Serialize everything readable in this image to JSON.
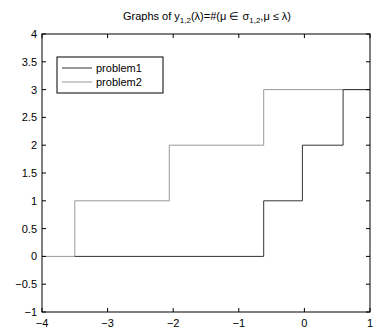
{
  "chart_data": {
    "type": "line",
    "subtype": "step",
    "title_parts": {
      "prefix": "Graphs of y",
      "sub1": "1,2",
      "middle": "(λ)=#(μ ∈ σ",
      "sub2": "1,2",
      "suffix": ",μ ≤ λ)"
    },
    "xlabel": "",
    "ylabel": "",
    "xlim": [
      -4,
      1
    ],
    "ylim": [
      -1,
      4
    ],
    "xticks": [
      -4,
      -3,
      -2,
      -1,
      0,
      1
    ],
    "xtick_labels": [
      "−4",
      "−3",
      "−2",
      "−1",
      "0",
      "1"
    ],
    "yticks": [
      -1,
      -0.5,
      0,
      0.5,
      1,
      1.5,
      2,
      2.5,
      3,
      3.5,
      4
    ],
    "ytick_labels": [
      "−1",
      "−0.5",
      "0",
      "0.5",
      "1",
      "1.5",
      "2",
      "2.5",
      "3",
      "3.5",
      "4"
    ],
    "grid": false,
    "legend_position": "upper left",
    "series": [
      {
        "name": "problem1",
        "color": "#333333",
        "x": [
          -3.5,
          -0.62,
          -0.62,
          -0.03,
          -0.03,
          0.59,
          0.59,
          1
        ],
        "y": [
          0,
          0,
          1,
          1,
          2,
          2,
          3,
          3
        ]
      },
      {
        "name": "problem2",
        "color": "#999999",
        "x": [
          -4,
          -3.5,
          -3.5,
          -2.06,
          -2.06,
          -0.62,
          -0.62,
          1
        ],
        "y": [
          0,
          0,
          1,
          1,
          2,
          2,
          3,
          3
        ]
      }
    ]
  },
  "legend": {
    "items": [
      {
        "label": "problem1",
        "color": "#333333"
      },
      {
        "label": "problem2",
        "color": "#999999"
      }
    ]
  }
}
